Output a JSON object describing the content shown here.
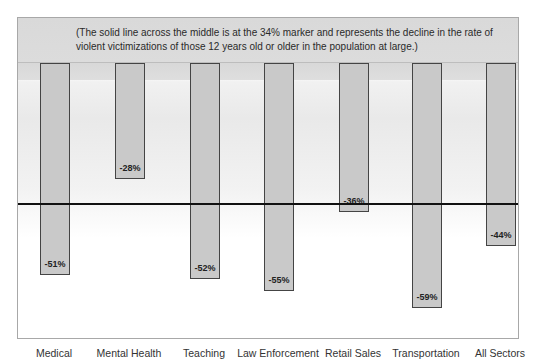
{
  "chart_data": {
    "type": "bar",
    "title": "",
    "note": "(The solid line across the middle is at the 34% marker and represents the decline in the rate of violent victimizations of those 12 years old or older in the population at large.)",
    "categories": [
      "Medical",
      "Mental Health",
      "Teaching",
      "Law Enforcement",
      "Retail Sales",
      "Transportation",
      "All Sectors"
    ],
    "values": [
      -51,
      -28,
      -52,
      -55,
      -36,
      -59,
      -44
    ],
    "value_labels": [
      "-51%",
      "-28%",
      "-52%",
      "-55%",
      "-36%",
      "-59%",
      "-44%"
    ],
    "reference_line": {
      "value": -34,
      "label": "34% marker"
    },
    "xlabel": "",
    "ylabel": "Decline in rate of violent victimization (%)",
    "ylim": [
      0,
      -65
    ],
    "grid": false,
    "legend": null
  },
  "colors": {
    "bar_fill": "#c9c9c9",
    "bar_border": "#444444",
    "reference_line": "#111111",
    "note_band": "#d9d9d9"
  }
}
